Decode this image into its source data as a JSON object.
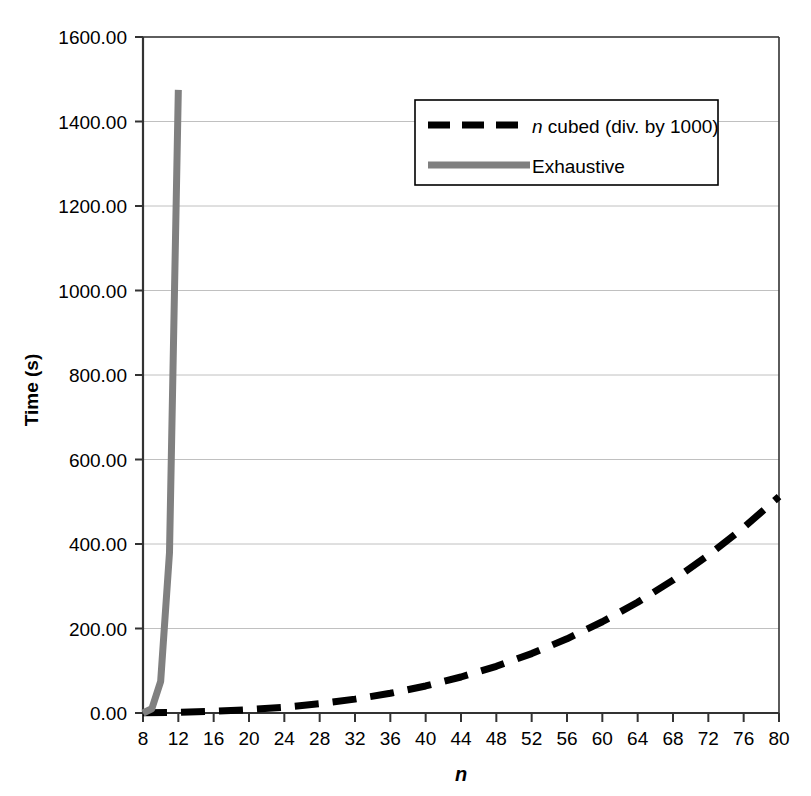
{
  "chart_data": {
    "type": "line",
    "title": "",
    "xlabel": "n",
    "ylabel": "Time (s)",
    "xlim": [
      8,
      80
    ],
    "ylim": [
      0,
      1600
    ],
    "xticks": [
      8,
      12,
      16,
      20,
      24,
      28,
      32,
      36,
      40,
      44,
      48,
      52,
      56,
      60,
      64,
      68,
      72,
      76,
      80
    ],
    "yticks": [
      0,
      200,
      400,
      600,
      800,
      1000,
      1200,
      1400,
      1600
    ],
    "ytick_labels": [
      "0.00",
      "200.00",
      "400.00",
      "600.00",
      "800.00",
      "1000.00",
      "1200.00",
      "1400.00",
      "1600.00"
    ],
    "xtick_labels": [
      "8",
      "12",
      "16",
      "20",
      "24",
      "28",
      "32",
      "36",
      "40",
      "44",
      "48",
      "52",
      "56",
      "60",
      "64",
      "68",
      "72",
      "76",
      "80"
    ],
    "grid": "horizontal",
    "grid_color": "#c0c0c0",
    "legend_position": "top-right",
    "series": [
      {
        "name": "n cubed (div. by 1000)",
        "name_italic_prefix": "n",
        "name_rest": " cubed (div. by 1000)",
        "style": "dashed",
        "color": "#000000",
        "width": 7,
        "x": [
          8,
          12,
          16,
          20,
          24,
          28,
          32,
          36,
          40,
          44,
          48,
          52,
          56,
          60,
          64,
          68,
          72,
          76,
          80
        ],
        "values": [
          0.51,
          1.73,
          4.1,
          8.0,
          13.82,
          21.95,
          32.77,
          46.66,
          64.0,
          85.18,
          110.59,
          140.61,
          175.62,
          216.0,
          262.14,
          314.43,
          373.25,
          438.98,
          512.0
        ]
      },
      {
        "name": "Exhaustive",
        "style": "solid",
        "color": "#808080",
        "width": 7,
        "x": [
          8,
          9,
          10,
          11,
          12
        ],
        "values": [
          0.0,
          10.0,
          75.0,
          380.0,
          1475.0
        ]
      }
    ]
  },
  "axes": {
    "y_axis_title": "Time (s)",
    "x_axis_title": "n"
  },
  "legend": {
    "items": [
      {
        "label_italic": "n",
        "label": " cubed (div. by 1000)",
        "swatch": "dashed-black-line",
        "color": "#000000"
      },
      {
        "label_italic": "",
        "label": "Exhaustive",
        "swatch": "solid-gray-line",
        "color": "#808080"
      }
    ]
  }
}
